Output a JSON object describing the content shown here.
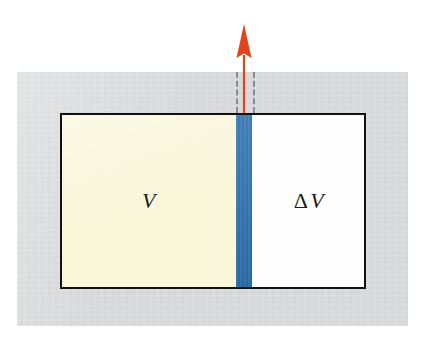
{
  "figure": {
    "background_color": "#ffffff",
    "panel_color": "#d3d5d7"
  },
  "container": {
    "border_color": "#111111",
    "regions": [
      {
        "id": "v",
        "name": "initial-volume-region",
        "label_delta": "",
        "label_symbol": "V",
        "fill_color": "#faf6da"
      },
      {
        "id": "slab",
        "name": "swept-layer-slab",
        "label_delta": "",
        "label_symbol": "",
        "fill_color": "#2d73b0"
      },
      {
        "id": "dv",
        "name": "added-volume-region",
        "label_delta": "Δ",
        "label_symbol": "V",
        "fill_color": "#fefefe"
      }
    ]
  },
  "annotations": {
    "arrow": {
      "name": "displacement-arrow",
      "direction": "up",
      "color": "#e0441b"
    },
    "guide_lines": {
      "name": "dashed-guide-lines",
      "style": "dashed",
      "color": "#8a8d90",
      "count": 2
    }
  }
}
